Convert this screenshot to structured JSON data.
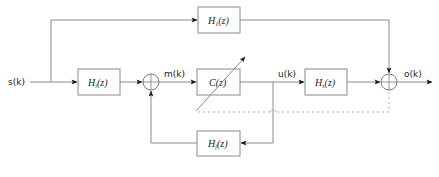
{
  "diagram": {
    "type": "block-diagram",
    "signals": {
      "input": "s(k)",
      "summer_output": "m(k)",
      "controller_output": "u(k)",
      "output": "o(k)"
    },
    "blocks": {
      "input_filter": {
        "name": "H",
        "sub": "i",
        "arg": "(z)"
      },
      "direct_path": {
        "name": "H",
        "sub": "1",
        "arg": "(z)"
      },
      "controller": {
        "name": "C",
        "sub": "",
        "arg": "(z)"
      },
      "secondary_path": {
        "name": "H",
        "sub": "s",
        "arg": "(z)"
      },
      "feedback_path": {
        "name": "H",
        "sub": "f",
        "arg": "(z)"
      }
    },
    "junctions": [
      "sum-1",
      "sum-2"
    ],
    "colors": {
      "wire": "#8a8a8a",
      "arrowhead": "#1a1a1a",
      "dashed": "#b0b0b0",
      "text": "#222222"
    }
  }
}
